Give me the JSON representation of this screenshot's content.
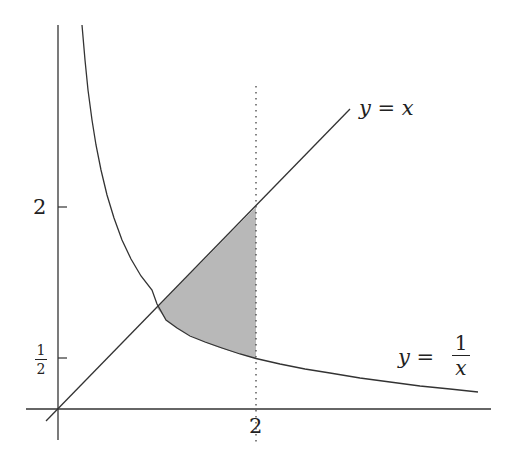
{
  "figure": {
    "type": "function-plot",
    "colors": {
      "line": "#333333",
      "shade": "#b8b8b8",
      "background": "#ffffff"
    },
    "axes": {
      "x_ticks": [
        {
          "value": 2,
          "label": "2"
        }
      ],
      "y_ticks": [
        {
          "value": 2,
          "label": "2"
        },
        {
          "value": 0.5,
          "label_num": "1",
          "label_den": "2"
        }
      ]
    },
    "curves": [
      {
        "name": "identity",
        "label": "y = x",
        "label_lhs": "y",
        "label_eq": "=",
        "label_rhs": "x"
      },
      {
        "name": "reciprocal",
        "label": "y = 1/x",
        "label_lhs": "y",
        "label_eq": "=",
        "label_num": "1",
        "label_den": "x"
      }
    ],
    "vertical_line": {
      "x": 2,
      "style": "dotted"
    },
    "shaded_region": {
      "x_from": 1,
      "x_to": 2,
      "upper": "y = x",
      "lower": "y = 1/x"
    }
  }
}
